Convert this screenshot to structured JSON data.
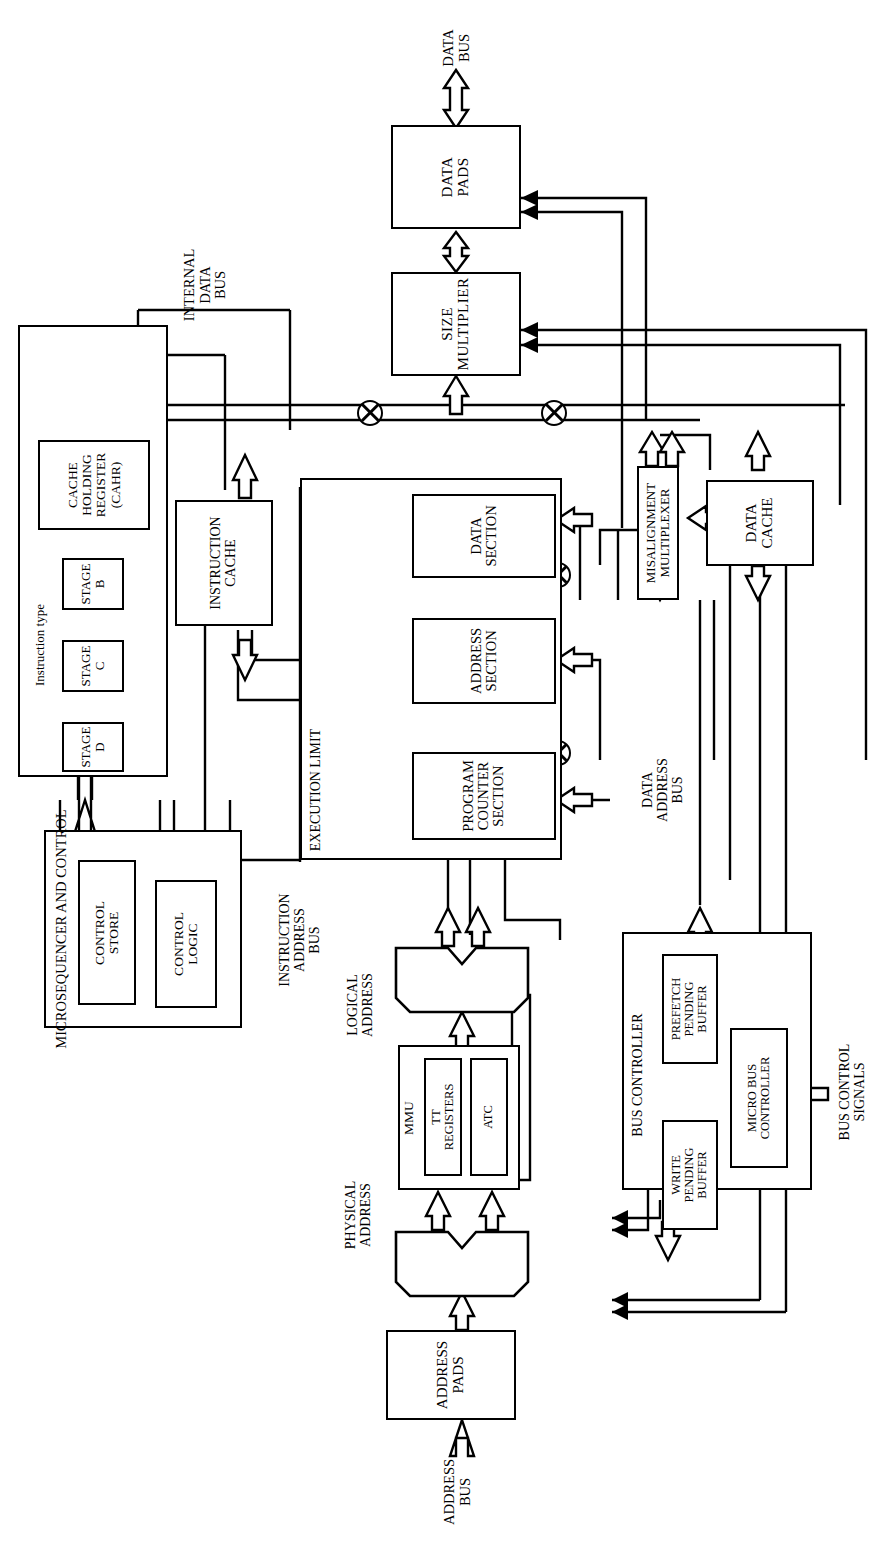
{
  "diagram": {
    "orientation": "rotated-90-ccw",
    "line_color": "#000000",
    "background": "#ffffff",
    "blocks": [
      {
        "id": "data-pads",
        "label": "DATA\nPADS"
      },
      {
        "id": "size-multiplier",
        "label": "SIZE\nMULTIPLIER"
      },
      {
        "id": "cache-holding-register",
        "label": "CACHE\nHOLDING\nREGISTER\n(CAHR)"
      },
      {
        "id": "stage-b",
        "label": "STAGE\nB"
      },
      {
        "id": "stage-c",
        "label": "STAGE\nC"
      },
      {
        "id": "stage-d",
        "label": "STAGE\nD"
      },
      {
        "id": "instruction-cache",
        "label": "INSTRUCTION\nCACHE"
      },
      {
        "id": "data-section",
        "label": "DATA\nSECTION"
      },
      {
        "id": "address-section",
        "label": "ADDRESS\nSECTION"
      },
      {
        "id": "program-counter-section",
        "label": "PROGRAM\nCOUNTER\nSECTION"
      },
      {
        "id": "misalignment-multiplexer",
        "label": "MISALIGNMENT\nMULTIPLEXER"
      },
      {
        "id": "data-cache",
        "label": "DATA\nCACHE"
      },
      {
        "id": "microsequencer",
        "label": "MICROSEQUENCER AND CONTROL"
      },
      {
        "id": "control-store",
        "label": "CONTROL\nSTORE"
      },
      {
        "id": "control-logic",
        "label": "CONTROL\nLOGIC"
      },
      {
        "id": "mmu",
        "label": "MMU"
      },
      {
        "id": "tt-registers",
        "label": "TT\nREGISTERS"
      },
      {
        "id": "atc",
        "label": "ATC"
      },
      {
        "id": "bus-controller",
        "label": "BUS CONTROLLER"
      },
      {
        "id": "prefetch-pending-buffer",
        "label": "PREFETCH\nPENDING\nBUFFER"
      },
      {
        "id": "write-pending-buffer",
        "label": "WRITE\nPENDING\nBUFFER"
      },
      {
        "id": "micro-bus-controller",
        "label": "MICRO BUS\nCONTROLLER"
      },
      {
        "id": "address-pads",
        "label": "ADDRESS\nPADS"
      }
    ],
    "bus_labels": [
      {
        "id": "data-bus",
        "label": "DATA\nBUS"
      },
      {
        "id": "internal-data-bus",
        "label": "INTERNAL\nDATA\nBUS"
      },
      {
        "id": "instruction-type",
        "label": "Instruction type"
      },
      {
        "id": "execution-limit",
        "label": "EXECUTION LIMIT"
      },
      {
        "id": "data-address-bus",
        "label": "DATA\nADDRESS\nBUS"
      },
      {
        "id": "instruction-address-bus",
        "label": "INSTRUCTION\nADDRESS\nBUS"
      },
      {
        "id": "logical-address",
        "label": "LOGICAL\nADDRESS"
      },
      {
        "id": "physical-address",
        "label": "PHYSICAL\nADDRESS"
      },
      {
        "id": "bus-control-signals",
        "label": "BUS CONTROL\nSIGNALS"
      },
      {
        "id": "address-bus",
        "label": "ADDRESS\nBUS"
      }
    ],
    "junctions": [
      {
        "id": "junction-1"
      },
      {
        "id": "junction-2"
      },
      {
        "id": "junction-3"
      },
      {
        "id": "junction-4"
      },
      {
        "id": "junction-5"
      },
      {
        "id": "junction-6"
      }
    ],
    "muxes": [
      {
        "id": "logical-address-mux"
      },
      {
        "id": "physical-address-mux"
      }
    ]
  }
}
